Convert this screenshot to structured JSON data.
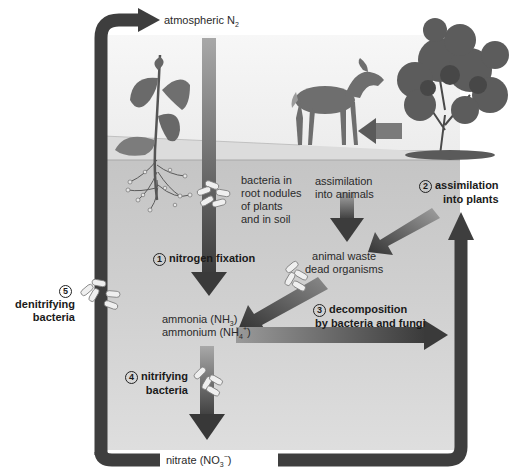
{
  "diagram": {
    "colors": {
      "cycle_arrow": "#3e3e3e",
      "panel_sky": "#f2f2f2",
      "panel_soil": "#bdbdbd",
      "soil_top": "#c9c9c9",
      "ground_surface": "#d8d8d8",
      "gradient_arrow_dark": "#404040",
      "gradient_arrow_light": "#a0a0a0",
      "bacteria_fill": "#ececec",
      "bacteria_stroke": "#777777"
    },
    "nodes": {
      "atmospheric_n2": {
        "text": "atmospheric N",
        "sub": "2"
      },
      "bacteria_nodules": {
        "lines": [
          "bacteria in",
          "root nodules",
          "of plants",
          "and in soil"
        ]
      },
      "assimilation_animals": {
        "lines": [
          "assimilation",
          "into animals"
        ]
      },
      "animal_waste": {
        "lines": [
          "animal waste",
          "dead organisms"
        ]
      },
      "ammonia": {
        "line1": "ammonia (NH",
        "line1_sub": "3",
        "line1_end": ")",
        "line2": "ammonium (NH",
        "line2_sub": "4",
        "line2_sup": "+",
        "line2_end": ")"
      },
      "nitrate": {
        "text": "nitrate (NO",
        "sub": "3",
        "sup": "−",
        "end": ")"
      }
    },
    "processes": [
      {
        "number": "1",
        "lines": [
          "nitrogen fixation"
        ]
      },
      {
        "number": "2",
        "lines": [
          "assimilation",
          "into plants"
        ]
      },
      {
        "number": "3",
        "lines": [
          "decomposition",
          "by bacteria and fungi"
        ]
      },
      {
        "number": "4",
        "lines": [
          "nitrifying",
          "bacteria"
        ]
      },
      {
        "number": "5",
        "lines": [
          "denitrifying",
          "bacteria"
        ]
      }
    ],
    "illustrations": [
      "legume-plant-with-root-nodules",
      "deer",
      "shrub"
    ]
  }
}
